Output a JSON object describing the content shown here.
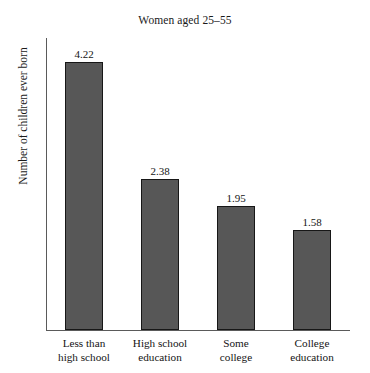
{
  "chart_data": {
    "type": "bar",
    "title": "Women aged 25–55",
    "xlabel": "",
    "ylabel": "Number of children ever born",
    "categories": [
      "Less than high school",
      "High school education",
      "Some college",
      "College education"
    ],
    "category_lines": [
      [
        "Less than",
        "high school"
      ],
      [
        "High school",
        "education"
      ],
      [
        "Some",
        "college"
      ],
      [
        "College",
        "education"
      ]
    ],
    "values": [
      4.22,
      2.38,
      1.95,
      1.58
    ],
    "value_labels": [
      "4.22",
      "2.38",
      "1.95",
      "1.58"
    ],
    "ylim": [
      0,
      4.6
    ],
    "grid": false,
    "legend": false,
    "bar_color": "#575757",
    "bar_border_color": "#171717",
    "axis_color": "#5a5a5a",
    "text_color": "#141414"
  }
}
